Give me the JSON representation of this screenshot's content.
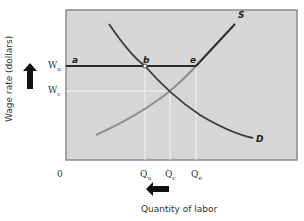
{
  "diagram": {
    "type": "labor market supply-demand diagram with wage floor",
    "axes": {
      "y_label": "Wage rate (dollars)",
      "x_label": "Quantity of labor",
      "origin": "0"
    },
    "y_ticks": [
      {
        "base": "W",
        "sub": "u"
      },
      {
        "base": "W",
        "sub": "c"
      }
    ],
    "x_ticks": [
      {
        "base": "Q",
        "sub": "u"
      },
      {
        "base": "Q",
        "sub": "c"
      },
      {
        "base": "Q",
        "sub": "e"
      }
    ],
    "curves": [
      {
        "name": "S",
        "label": "S",
        "description": "Supply curve, kinked at e (horizontal segment a-b-e at Wu, gray below)"
      },
      {
        "name": "D",
        "label": "D",
        "description": "Downward sloping labor demand curve"
      }
    ],
    "points": [
      {
        "label": "a"
      },
      {
        "label": "b"
      },
      {
        "label": "e"
      }
    ],
    "arrows": [
      {
        "direction": "up",
        "meaning": "wage rises"
      },
      {
        "direction": "left",
        "meaning": "quantity of labor decreases"
      }
    ],
    "colors": {
      "plot_bg": "#d6d6d6",
      "plot_border": "#8a8a8a",
      "dark_line": "#2b2b2b",
      "demand_line": "#3a3a3a",
      "gray_supply": "#8e8e8e",
      "guide_line": "#f2f2f2"
    }
  }
}
